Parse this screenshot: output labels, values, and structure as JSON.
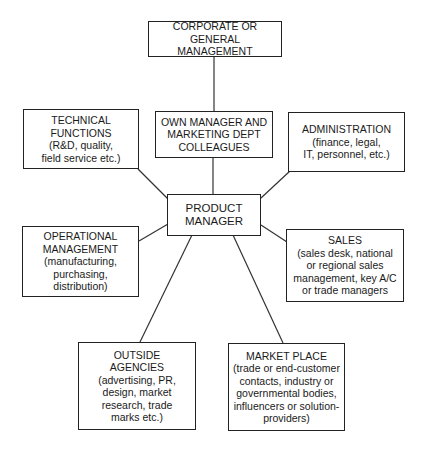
{
  "diagram": {
    "type": "relationship-map",
    "center": {
      "id": "product-manager",
      "title": "PRODUCT\nMANAGER"
    },
    "nodes": [
      {
        "id": "corporate",
        "title": "CORPORATE OR\nGENERAL MANAGEMENT",
        "detail": ""
      },
      {
        "id": "own-manager",
        "title": "OWN MANAGER AND\nMARKETING DEPT\nCOLLEAGUES",
        "detail": ""
      },
      {
        "id": "technical",
        "title": "TECHNICAL\nFUNCTIONS",
        "detail": "(R&D, quality,\nfield service etc.)"
      },
      {
        "id": "administration",
        "title": "ADMINISTRATION",
        "detail": "(finance, legal,\nIT, personnel, etc.)"
      },
      {
        "id": "operational",
        "title": "OPERATIONAL\nMANAGEMENT",
        "detail": "(manufacturing,\npurchasing,\ndistribution)"
      },
      {
        "id": "sales",
        "title": "SALES",
        "detail": "(sales desk, national\nor regional sales\nmanagement, key A/C\nor trade managers"
      },
      {
        "id": "outside-agencies",
        "title": "OUTSIDE\nAGENCIES",
        "detail": "(advertising, PR,\ndesign, market\nresearch, trade\nmarks etc.)"
      },
      {
        "id": "market-place",
        "title": "MARKET PLACE",
        "detail": "(trade or end-customer\ncontacts, industry or\ngovernmental bodies,\ninfluencers or solution-\nproviders)"
      }
    ],
    "edges": [
      {
        "from": "corporate",
        "to": "own-manager"
      },
      {
        "from": "own-manager",
        "to": "product-manager"
      },
      {
        "from": "technical",
        "to": "product-manager"
      },
      {
        "from": "administration",
        "to": "product-manager"
      },
      {
        "from": "operational",
        "to": "product-manager"
      },
      {
        "from": "sales",
        "to": "product-manager"
      },
      {
        "from": "outside-agencies",
        "to": "product-manager"
      },
      {
        "from": "market-place",
        "to": "product-manager"
      }
    ],
    "colors": {
      "line": "#333333",
      "border": "#222222",
      "background": "#ffffff",
      "text": "#1a1a1a"
    }
  }
}
